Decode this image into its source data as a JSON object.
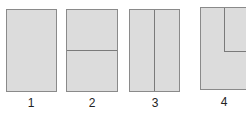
{
  "diagram": {
    "colors": {
      "fill": "#dcdcdc",
      "border": "#8a8a8a",
      "divider": "#7a7a7a",
      "label": "#222222"
    },
    "panels": [
      {
        "id": 1,
        "label": "1",
        "layout": "single"
      },
      {
        "id": 2,
        "label": "2",
        "layout": "horizontal-split"
      },
      {
        "id": 3,
        "label": "3",
        "layout": "vertical-split"
      },
      {
        "id": 4,
        "label": "4",
        "layout": "inset-top-right"
      }
    ]
  }
}
